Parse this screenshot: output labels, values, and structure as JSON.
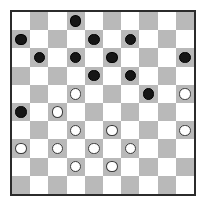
{
  "game": {
    "name": "checkers-board",
    "board_size": 10,
    "colors": {
      "light_square": "#ffffff",
      "dark_square": "#b9b9b9",
      "border": "#2b2b2b",
      "black_piece": "#161616",
      "white_piece": "#ffffff",
      "white_piece_outline": "#3a3a3a"
    },
    "light_square_first": true,
    "piece_labels": {
      "black": "black-piece",
      "white": "white-piece",
      "empty": "empty-square"
    },
    "counts": {
      "black_pieces": 16,
      "white_pieces": 15
    },
    "rows": [
      [
        "",
        "",
        "",
        "black",
        "",
        "",
        "",
        "",
        "",
        ""
      ],
      [
        "black",
        "",
        "",
        "",
        "black",
        "",
        "black",
        "",
        "",
        ""
      ],
      [
        "",
        "black",
        "",
        "black",
        "",
        "black",
        "",
        "",
        "",
        "black"
      ],
      [
        "",
        "",
        "",
        "",
        "black",
        "",
        "black",
        "",
        "",
        ""
      ],
      [
        "",
        "",
        "",
        "white",
        "",
        "",
        "",
        "black",
        "",
        "white"
      ],
      [
        "black",
        "",
        "white",
        "",
        "",
        "",
        "",
        "",
        "",
        ""
      ],
      [
        "",
        "",
        "",
        "white",
        "",
        "white",
        "",
        "",
        "",
        "white"
      ],
      [
        "white",
        "",
        "white",
        "",
        "white",
        "",
        "white",
        "",
        "",
        ""
      ],
      [
        "",
        "",
        "",
        "white",
        "",
        "white",
        "",
        "",
        "",
        ""
      ],
      [
        "",
        "",
        "",
        "",
        "",
        "",
        "",
        "",
        "",
        ""
      ]
    ]
  }
}
